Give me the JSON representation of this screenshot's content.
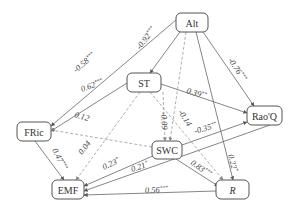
{
  "diagram": {
    "type": "structural-equation-model path diagram",
    "nodes": [
      {
        "id": "Alt",
        "label": "Alt",
        "x": 176,
        "y": 13,
        "w": 32,
        "h": 19,
        "italic": false
      },
      {
        "id": "ST",
        "label": "ST",
        "x": 127,
        "y": 73,
        "w": 34,
        "h": 19,
        "italic": false
      },
      {
        "id": "FRic",
        "label": "FRic",
        "x": 17,
        "y": 122,
        "w": 34,
        "h": 19,
        "italic": false
      },
      {
        "id": "RaoQ",
        "label": "Rao'Q",
        "x": 247,
        "y": 106,
        "w": 35,
        "h": 19,
        "italic": false
      },
      {
        "id": "SWC",
        "label": "SWC",
        "x": 152,
        "y": 141,
        "w": 30,
        "h": 18,
        "italic": false
      },
      {
        "id": "EMF",
        "label": "EMF",
        "x": 52,
        "y": 180,
        "w": 32,
        "h": 19,
        "italic": false
      },
      {
        "id": "R",
        "label": "R",
        "x": 216,
        "y": 180,
        "w": 33,
        "h": 19,
        "italic": true
      }
    ],
    "edges": [
      {
        "from": "Alt",
        "to": "FRic",
        "coef": "-0.58",
        "sig": "***",
        "style": "solid",
        "path": [
          176,
          20,
          51,
          126
        ],
        "label_pos": [
          76,
          73
        ],
        "angle": -40
      },
      {
        "from": "Alt",
        "to": "ST",
        "coef": "-0.92",
        "sig": "***",
        "style": "solid",
        "path": [
          180,
          32,
          150,
          73
        ],
        "label_pos": [
          140,
          50
        ],
        "angle": -52
      },
      {
        "from": "Alt",
        "to": "SWC",
        "coef": "",
        "sig": "",
        "style": "dashed",
        "path": [
          186,
          32,
          170,
          141
        ],
        "label_pos": null,
        "angle": 0
      },
      {
        "from": "Alt",
        "to": "RaoQ",
        "coef": "-0.76",
        "sig": "***",
        "style": "solid",
        "path": [
          203,
          32,
          254,
          106
        ],
        "label_pos": [
          228,
          60
        ],
        "angle": 57
      },
      {
        "from": "Alt",
        "to": "R",
        "coef": "0.22",
        "sig": "*",
        "style": "solid",
        "path": [
          196,
          32,
          233,
          180
        ],
        "label_pos": [
          228,
          155
        ],
        "angle": 76
      },
      {
        "from": "ST",
        "to": "FRic",
        "coef": "0.62",
        "sig": "***",
        "style": "solid",
        "path": [
          127,
          83,
          51,
          131
        ],
        "label_pos": [
          82,
          92
        ],
        "angle": -20
      },
      {
        "from": "ST",
        "to": "RaoQ",
        "coef": "0.39",
        "sig": "**",
        "style": "solid",
        "path": [
          161,
          84,
          247,
          113
        ],
        "label_pos": [
          186,
          93
        ],
        "angle": 17
      },
      {
        "from": "ST",
        "to": "SWC",
        "coef": "-0.09",
        "sig": "",
        "style": "dashed",
        "path": [
          163,
          92,
          165,
          141
        ],
        "label_pos": [
          161,
          112
        ],
        "angle": 87
      },
      {
        "from": "ST",
        "to": "R",
        "coef": "-0.14",
        "sig": "",
        "style": "dashed",
        "path": [
          150,
          92,
          223,
          180
        ],
        "label_pos": [
          178,
          112
        ],
        "angle": 57
      },
      {
        "from": "ST",
        "to": "EMF",
        "coef": "0.04",
        "sig": "",
        "style": "dashed",
        "path": [
          140,
          92,
          76,
          180
        ],
        "label_pos": [
          82,
          155
        ],
        "angle": -52
      },
      {
        "from": "SWC",
        "to": "FRic",
        "coef": "0.12",
        "sig": "",
        "style": "dashed",
        "path": [
          152,
          147,
          51,
          130
        ],
        "label_pos": [
          74,
          117
        ],
        "angle": 17
      },
      {
        "from": "SWC",
        "to": "RaoQ",
        "coef": "-0.35",
        "sig": "**",
        "style": "solid",
        "path": [
          182,
          145,
          247,
          122
        ],
        "label_pos": [
          195,
          134
        ],
        "angle": -16
      },
      {
        "from": "SWC",
        "to": "EMF",
        "coef": "0.23",
        "sig": "*",
        "style": "solid",
        "path": [
          155,
          155,
          84,
          186
        ],
        "label_pos": [
          104,
          170
        ],
        "angle": -25
      },
      {
        "from": "SWC",
        "to": "R",
        "coef": "0.83",
        "sig": "***",
        "style": "solid",
        "path": [
          176,
          159,
          218,
          186
        ],
        "label_pos": [
          190,
          164
        ],
        "angle": 35
      },
      {
        "from": "RaoQ",
        "to": "EMF",
        "coef": "0.21",
        "sig": "*",
        "style": "solid",
        "path": [
          270,
          125,
          84,
          191
        ],
        "label_pos": [
          132,
          172
        ],
        "angle": -18
      },
      {
        "from": "FRic",
        "to": "EMF",
        "coef": "0.47",
        "sig": "***",
        "style": "solid",
        "path": [
          35,
          141,
          64,
          180
        ],
        "label_pos": [
          52,
          150
        ],
        "angle": 63
      },
      {
        "from": "R",
        "to": "EMF",
        "coef": "0.56",
        "sig": "***",
        "style": "solid",
        "path": [
          216,
          191,
          84,
          195
        ],
        "label_pos": [
          145,
          193
        ],
        "angle": -2
      }
    ]
  }
}
